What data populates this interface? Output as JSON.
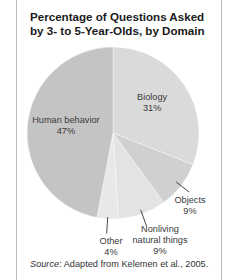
{
  "chart_data": {
    "type": "pie",
    "title": "Percentage of Questions Asked by 3- to 5-Year-Olds, by Domain",
    "title_lines": [
      "Percentage of Questions Asked",
      "by 3- to 5-Year-Olds, by Domain"
    ],
    "slices": [
      {
        "label": "Biology",
        "label_lines": [
          "Biology"
        ],
        "value": 31,
        "value_label": "31%",
        "color": "#dadada"
      },
      {
        "label": "Objects",
        "label_lines": [
          "Objects"
        ],
        "value": 9,
        "value_label": "9%",
        "color": "#d0d0d0"
      },
      {
        "label": "Nonliving natural things",
        "label_lines": [
          "Nonliving",
          "natural things"
        ],
        "value": 9,
        "value_label": "9%",
        "color": "#e3e3e3"
      },
      {
        "label": "Other",
        "label_lines": [
          "Other"
        ],
        "value": 4,
        "value_label": "4%",
        "color": "#e8e8e8"
      },
      {
        "label": "Human behavior",
        "label_lines": [
          "Human behavior"
        ],
        "value": 47,
        "value_label": "47%",
        "color": "#c4c4c4"
      }
    ],
    "start": "top",
    "direction": "clockwise",
    "source_prefix": "Source",
    "source_text": ": Adapted from Kelemen et al., 2005."
  }
}
